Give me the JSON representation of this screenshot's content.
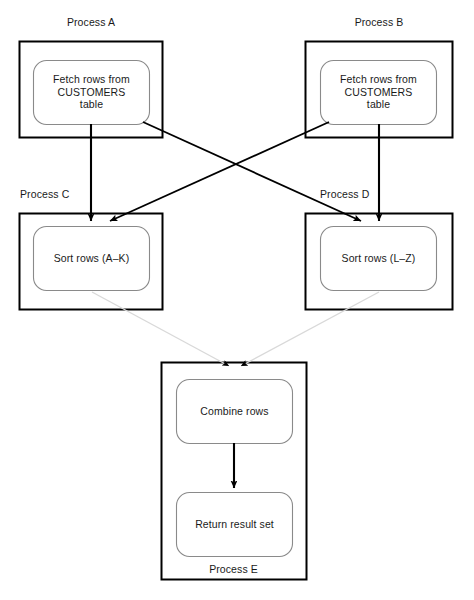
{
  "diagram": {
    "colors": {
      "outer_box_stroke": "#000000",
      "inner_box_stroke": "#8a8a8a",
      "arrow_dark": "#000000",
      "arrow_faint": "#d9d9d9",
      "text": "#1a1a1a",
      "background": "#ffffff"
    },
    "processes": [
      {
        "id": "process-a",
        "label": "Process A",
        "label_position": "above-centered",
        "node": {
          "id": "node-fetch-a",
          "text": "Fetch rows from\nCUSTOMERS\ntable"
        }
      },
      {
        "id": "process-b",
        "label": "Process B",
        "label_position": "above-centered",
        "node": {
          "id": "node-fetch-b",
          "text": "Fetch rows from\nCUSTOMERS\ntable"
        }
      },
      {
        "id": "process-c",
        "label": "Process C",
        "label_position": "above-left",
        "node": {
          "id": "node-sort-c",
          "text": "Sort rows (A–K)"
        }
      },
      {
        "id": "process-d",
        "label": "Process D",
        "label_position": "above-left",
        "node": {
          "id": "node-sort-d",
          "text": "Sort rows (L–Z)"
        }
      },
      {
        "id": "process-e",
        "label": "Process E",
        "label_position": "inside-bottom",
        "nodes": [
          {
            "id": "node-combine",
            "text": "Combine rows"
          },
          {
            "id": "node-return",
            "text": "Return result set"
          }
        ]
      }
    ],
    "connections": [
      {
        "from": "process-a",
        "to": "process-c",
        "style": "solid-dark"
      },
      {
        "from": "process-a",
        "to": "process-d",
        "style": "solid-dark"
      },
      {
        "from": "process-b",
        "to": "process-c",
        "style": "solid-dark"
      },
      {
        "from": "process-b",
        "to": "process-d",
        "style": "solid-dark"
      },
      {
        "from": "process-c",
        "to": "process-e",
        "style": "faint"
      },
      {
        "from": "process-d",
        "to": "process-e",
        "style": "faint"
      },
      {
        "from": "node-combine",
        "to": "node-return",
        "style": "solid-dark"
      }
    ]
  }
}
